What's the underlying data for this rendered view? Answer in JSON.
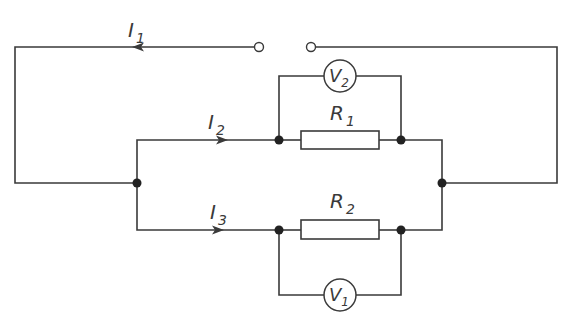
{
  "diagram": {
    "type": "electric circuit",
    "currents": [
      {
        "symbol": "I",
        "subscript": "1"
      },
      {
        "symbol": "I",
        "subscript": "2"
      },
      {
        "symbol": "I",
        "subscript": "3"
      }
    ],
    "resistors": [
      {
        "symbol": "R",
        "subscript": "1"
      },
      {
        "symbol": "R",
        "subscript": "2"
      }
    ],
    "voltmeters": [
      {
        "symbol": "V",
        "subscript": "2"
      },
      {
        "symbol": "V",
        "subscript": "1"
      }
    ],
    "colors": {
      "line": "#3a3a3a",
      "node": "#222222",
      "background": "#ffffff"
    }
  }
}
